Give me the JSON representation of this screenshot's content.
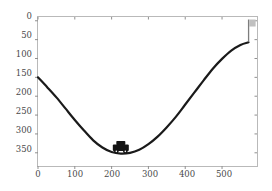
{
  "figure": {
    "top_caption": "d t th   t i ll      t i    th      lid     ith  t d  th    l ",
    "bottom_caption": "",
    "background_color": "#ffffff",
    "frame_color": "#b9b9b9"
  },
  "axes": {
    "x_ticks": [
      "0",
      "100",
      "200",
      "300",
      "400",
      "500"
    ],
    "x_tick_values": [
      0,
      100,
      200,
      300,
      400,
      500
    ],
    "y_ticks": [
      "0",
      "50",
      "100",
      "150",
      "200",
      "250",
      "300",
      "350"
    ],
    "y_tick_values": [
      0,
      50,
      100,
      150,
      200,
      250,
      300,
      350
    ],
    "xlabel": "",
    "ylabel": "",
    "y_axis_inverted": true
  },
  "markers": {
    "car": {
      "label": "car",
      "x": 225,
      "y": 352,
      "color": "#141414"
    },
    "flag": {
      "label": "goal-flag",
      "x": 572,
      "y": 55,
      "pole_color": "#7d7d7d",
      "flag_color": "#c0c0c0"
    }
  },
  "chart_data": {
    "type": "line",
    "title": "",
    "xlabel": "",
    "ylabel": "",
    "xlim": [
      0,
      595
    ],
    "ylim": [
      385,
      -10
    ],
    "grid": false,
    "legend": null,
    "series": [
      {
        "name": "terrain",
        "color": "#1a1a1a",
        "linewidth": 2.2,
        "x": [
          0,
          25,
          50,
          75,
          100,
          125,
          150,
          175,
          200,
          225,
          250,
          275,
          300,
          325,
          350,
          375,
          400,
          425,
          450,
          475,
          500,
          525,
          550,
          572
        ],
        "y": [
          150,
          176,
          203,
          233,
          263,
          291,
          317,
          336,
          348,
          352,
          350,
          342,
          327,
          307,
          282,
          254,
          222,
          190,
          158,
          127,
          101,
          79,
          64,
          57
        ]
      }
    ]
  }
}
